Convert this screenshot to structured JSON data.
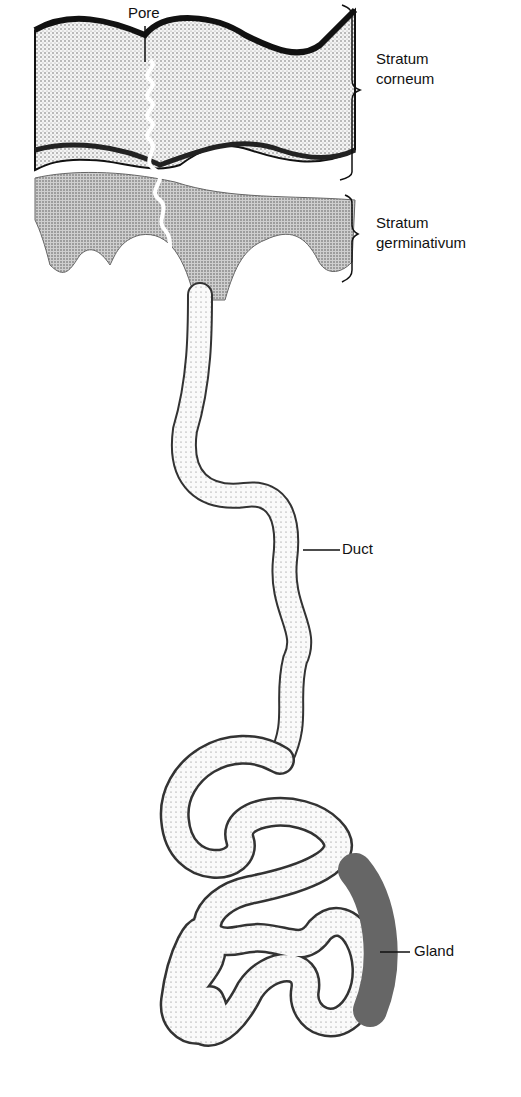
{
  "figure": {
    "labels": {
      "pore": "Pore",
      "stratum_corneum_line1": "Stratum",
      "stratum_corneum_line2": "corneum",
      "stratum_germinativum_line1": "Stratum",
      "stratum_germinativum_line2": "germinativum",
      "duct": "Duct",
      "gland": "Gland"
    },
    "colors": {
      "ink": "#111111",
      "background": "#ffffff",
      "stipple_dark": "#555555",
      "stipple_light": "#bdbdbd"
    }
  }
}
